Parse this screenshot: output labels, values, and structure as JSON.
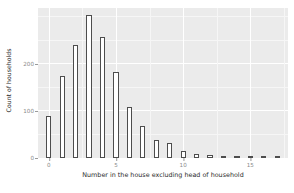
{
  "chart_data": {
    "type": "bar",
    "title": "",
    "subtitle": "",
    "xlabel": "Number in the house excluding head of household",
    "ylabel": "Count of households",
    "categories": [
      0,
      1,
      2,
      3,
      4,
      5,
      6,
      7,
      8,
      9,
      10,
      11,
      12,
      13,
      14,
      15,
      16,
      17
    ],
    "values": [
      89,
      176,
      241,
      306,
      259,
      184,
      109,
      68,
      38,
      33,
      14,
      8,
      6,
      2,
      2,
      1,
      1,
      3
    ],
    "xlim": [
      -0.8,
      17.8
    ],
    "ylim": [
      0,
      320
    ],
    "x_ticks": [
      0,
      5,
      10,
      15
    ],
    "x_tick_labels": [
      "0",
      "5",
      "10",
      "15"
    ],
    "y_ticks": [
      0,
      100,
      200
    ],
    "y_tick_labels": [
      "0",
      "100",
      "200"
    ],
    "y_minor_ticks": [
      50,
      150,
      250,
      300
    ],
    "x_minor_ticks": [
      2.5,
      7.5,
      12.5,
      17.5
    ],
    "grid": true,
    "legend": null,
    "bar_fill": "#ffffff",
    "bar_outline": "#4d4d4d",
    "panel_background": "#ebebeb",
    "gridline_color": "#ffffff",
    "axis_text_color": "#8a8a8a",
    "axis_title_color": "#2b2b2b"
  }
}
